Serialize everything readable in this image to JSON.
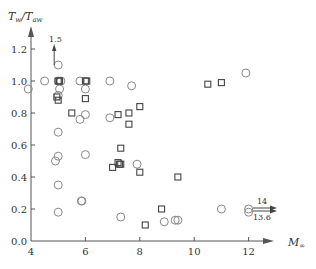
{
  "chart_data": {
    "type": "scatter",
    "title": "",
    "xlabel": "M∞",
    "ylabel": "Tw/Taw",
    "xlim": [
      4,
      12.8
    ],
    "ylim": [
      0,
      1.35
    ],
    "xticks": [
      4,
      6,
      8,
      10,
      12
    ],
    "xtick_labels": [
      "4",
      "6",
      "8",
      "10",
      "12"
    ],
    "yticks": [
      0.0,
      0.2,
      0.4,
      0.6,
      0.8,
      1.0,
      1.2
    ],
    "ytick_labels": [
      "0.0",
      "0.2",
      "0.4",
      "0.6",
      "0.8",
      "1.0",
      "1.2"
    ],
    "grid": false,
    "legend": null,
    "series": [
      {
        "name": "circles",
        "marker": "circle",
        "points": [
          [
            3.9,
            0.95
          ],
          [
            4.5,
            1.0
          ],
          [
            5.0,
            1.1
          ],
          [
            5.0,
            1.0
          ],
          [
            5.1,
            1.0
          ],
          [
            5.05,
            0.95
          ],
          [
            5.0,
            0.91
          ],
          [
            5.0,
            0.68
          ],
          [
            5.0,
            0.53
          ],
          [
            4.9,
            0.5
          ],
          [
            5.0,
            0.35
          ],
          [
            5.0,
            0.18
          ],
          [
            5.8,
            1.0
          ],
          [
            6.0,
            0.95
          ],
          [
            6.0,
            0.79
          ],
          [
            5.8,
            0.76
          ],
          [
            6.0,
            0.54
          ],
          [
            5.85,
            0.25
          ],
          [
            5.87,
            0.25
          ],
          [
            6.9,
            1.0
          ],
          [
            6.9,
            0.77
          ],
          [
            7.7,
            0.97
          ],
          [
            7.9,
            0.48
          ],
          [
            7.3,
            0.15
          ],
          [
            8.9,
            0.12
          ],
          [
            9.3,
            0.13
          ],
          [
            9.4,
            0.13
          ],
          [
            11.0,
            0.2
          ],
          [
            11.9,
            1.05
          ],
          [
            12.0,
            0.2
          ],
          [
            12.0,
            0.18
          ]
        ]
      },
      {
        "name": "squares",
        "marker": "square",
        "points": [
          [
            5.0,
            1.0
          ],
          [
            5.05,
            1.0
          ],
          [
            4.95,
            0.9
          ],
          [
            5.0,
            0.88
          ],
          [
            6.0,
            1.0
          ],
          [
            6.05,
            1.0
          ],
          [
            6.0,
            0.89
          ],
          [
            5.5,
            0.8
          ],
          [
            7.2,
            0.79
          ],
          [
            7.6,
            0.8
          ],
          [
            7.6,
            0.73
          ],
          [
            8.0,
            0.84
          ],
          [
            7.3,
            0.58
          ],
          [
            7.0,
            0.46
          ],
          [
            7.2,
            0.49
          ],
          [
            7.25,
            0.48
          ],
          [
            7.3,
            0.48
          ],
          [
            8.0,
            0.43
          ],
          [
            9.4,
            0.4
          ],
          [
            8.8,
            0.2
          ],
          [
            8.2,
            0.1
          ],
          [
            10.5,
            0.98
          ],
          [
            11.0,
            0.99
          ]
        ]
      }
    ],
    "annotations": [
      {
        "text": "1.5",
        "at": [
          5.0,
          1.1
        ],
        "direction": "up",
        "meaning": "off-scale value 1.5"
      },
      {
        "text": "14",
        "at": [
          12.0,
          0.2
        ],
        "direction": "right",
        "meaning": "off-scale M∞ = 14"
      },
      {
        "text": "13.6",
        "at": [
          12.0,
          0.18
        ],
        "direction": "right",
        "meaning": "off-scale M∞ = 13.6"
      }
    ]
  },
  "labels": {
    "ylabel_main": "T",
    "ylabel_sub1": "w",
    "ylabel_slash": "/T",
    "ylabel_sub2": "aw",
    "xlabel_main": "M",
    "xlabel_sub": "∞",
    "annot_up": "1.5",
    "annot_right_top": "14",
    "annot_right_bottom": "13.6"
  },
  "style": {
    "axis_color": "#555555",
    "marker_circle_color": "#888888",
    "marker_square_color": "#444444"
  }
}
